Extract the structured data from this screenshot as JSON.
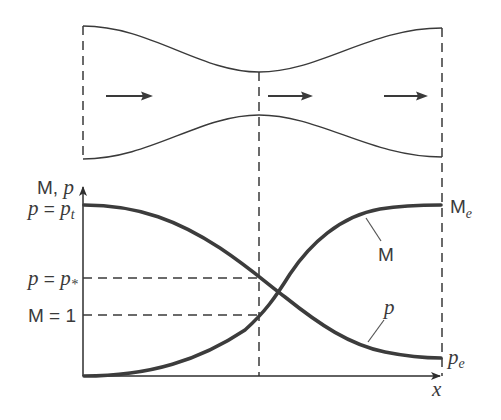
{
  "diagram": {
    "nozzle": {
      "flow_arrows": 3,
      "sections": [
        "inlet",
        "throat",
        "exit"
      ]
    },
    "axes": {
      "y_label_main": "M, ",
      "y_label_p": "p",
      "x_label": "x"
    },
    "levels": {
      "p_t": {
        "lhs": "p",
        "eq": " = ",
        "rhs": "p",
        "sub": "t"
      },
      "p_star": {
        "lhs": "p",
        "eq": " = ",
        "rhs": "p",
        "sub": "*"
      },
      "m_one": {
        "text": "M = 1"
      }
    },
    "curve_labels": {
      "mach": "M",
      "pressure": "p",
      "mach_exit_main": "M",
      "mach_exit_sub": "e",
      "pressure_exit_main": "p",
      "pressure_exit_sub": "e"
    },
    "colors": {
      "line": "#3a3a3a",
      "curve": "#3c3c3c",
      "background": "#ffffff"
    }
  }
}
